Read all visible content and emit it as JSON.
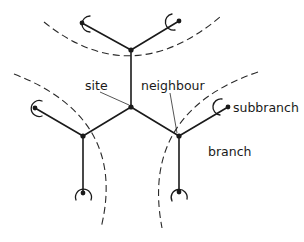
{
  "diagram": {
    "type": "Bethe lattice / branching tree schematic",
    "labels": {
      "site": "site",
      "neighbour": "neighbour",
      "subbranch": "subbranch",
      "branch": "branch"
    },
    "nodes": [
      {
        "id": "center",
        "role": "site"
      },
      {
        "id": "top"
      },
      {
        "id": "lower-left"
      },
      {
        "id": "lower-right",
        "role": "neighbour"
      }
    ],
    "branches": [
      {
        "id": "top-branch",
        "subbranches": 2
      },
      {
        "id": "left-branch",
        "subbranches": 2
      },
      {
        "id": "right-branch",
        "subbranches": 2
      }
    ],
    "colors": {
      "ink": "#1a1a1a",
      "background": "#ffffff"
    }
  }
}
